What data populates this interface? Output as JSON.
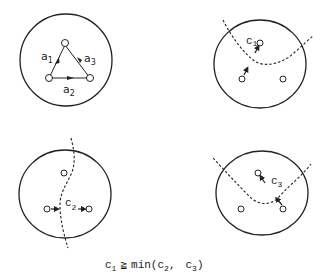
{
  "panels": [
    {
      "id": "top-left",
      "description": "graph with three nodes and directed edges",
      "edge_labels": [
        {
          "base": "a",
          "sub": "1"
        },
        {
          "base": "a",
          "sub": "2"
        },
        {
          "base": "a",
          "sub": "3"
        }
      ]
    },
    {
      "id": "top-right",
      "description": "cut separating top node",
      "cut_label": {
        "base": "c",
        "sub": "1"
      }
    },
    {
      "id": "bottom-left",
      "description": "cut separating left and right nodes",
      "cut_label": {
        "base": "c",
        "sub": "2"
      }
    },
    {
      "id": "bottom-right",
      "description": "cut separating top and bottom-right nodes",
      "cut_label": {
        "base": "c",
        "sub": "3"
      }
    }
  ],
  "equation": {
    "c_base": "c",
    "c_sub": "1",
    "relation": "≧",
    "func": "min(",
    "arg1_base": "c",
    "arg1_sub": "2",
    "comma": ",",
    "arg2_base": "c",
    "arg2_sub": "3",
    "close": ")"
  }
}
